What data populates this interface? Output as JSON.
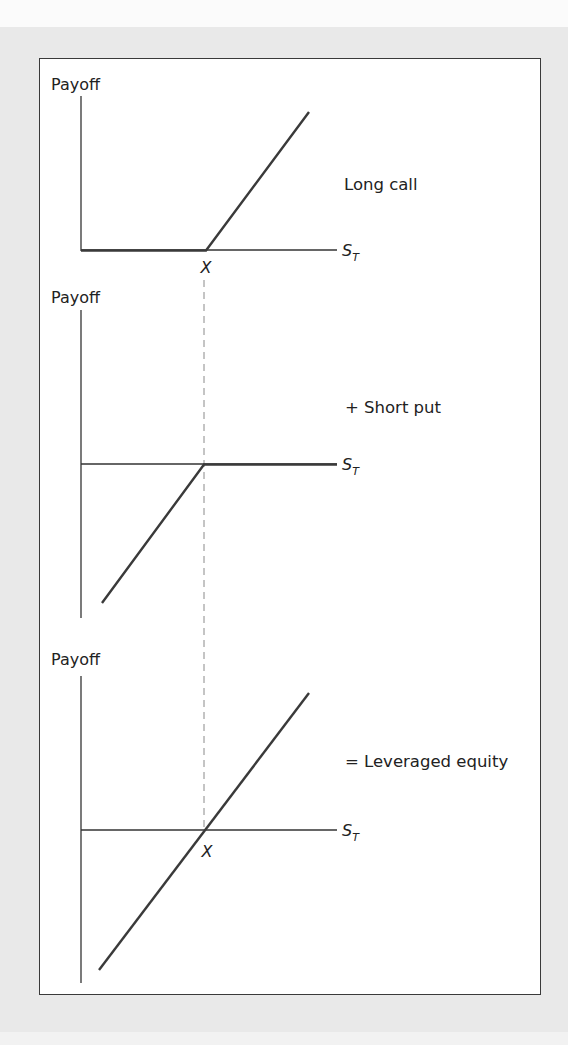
{
  "figure": {
    "panels": [
      {
        "id": "long-call",
        "y_axis_label": "Payoff",
        "x_axis_label": "S",
        "x_axis_subscript": "T",
        "strike_label": "X",
        "caption": "Long call"
      },
      {
        "id": "short-put",
        "y_axis_label": "Payoff",
        "x_axis_label": "S",
        "x_axis_subscript": "T",
        "caption": "+ Short put"
      },
      {
        "id": "leveraged-equity",
        "y_axis_label": "Payoff",
        "x_axis_label": "S",
        "x_axis_subscript": "T",
        "strike_label": "X",
        "caption": "= Leveraged equity"
      }
    ],
    "colors": {
      "background": "#e9e9e9",
      "frame_border": "#3a3a3a",
      "axis": "#333333",
      "payoff_line": "#3a3a3a",
      "dashed_guide": "#8a8a8a",
      "text": "#222222"
    }
  }
}
